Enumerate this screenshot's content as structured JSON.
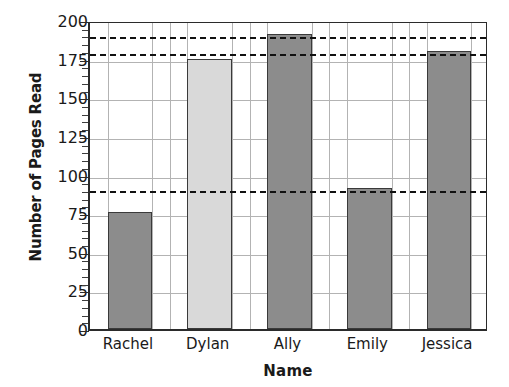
{
  "chart_data": {
    "type": "bar",
    "title": "",
    "xlabel": "Name",
    "ylabel": "Number of Pages Read",
    "categories": [
      "Rachel",
      "Dylan",
      "Ally",
      "Emily",
      "Jessica"
    ],
    "values": [
      76,
      175,
      191,
      91,
      180
    ],
    "bar_colors": [
      "#8c8c8c",
      "#d9d9d9",
      "#8c8c8c",
      "#8c8c8c",
      "#8c8c8c"
    ],
    "ylim": [
      0,
      200
    ],
    "yticks": [
      0,
      25,
      50,
      75,
      100,
      125,
      150,
      175,
      200
    ],
    "ytick_labels": [
      "0",
      "25",
      "50",
      "75",
      "100",
      "125",
      "150",
      "175",
      "200"
    ],
    "y_minor_tick_step": 5,
    "grid": "both",
    "legend": "none",
    "reference_lines": [
      {
        "name": "upper-dashed-reference-line",
        "value": 191,
        "style": "dashed"
      },
      {
        "name": "middle-dashed-reference-line",
        "value": 180,
        "style": "dashed"
      },
      {
        "name": "lower-dashed-reference-line",
        "value": 91,
        "style": "dashed"
      }
    ],
    "colors": {
      "bar_fill_dark": "#8c8c8c",
      "bar_fill_light": "#d9d9d9",
      "bar_stroke": "#3a3a3a",
      "axis": "#2b2b2b",
      "grid": "#b3b3b3",
      "dashed": "#111111",
      "text": "#1a1a1a",
      "background": "#ffffff"
    }
  }
}
